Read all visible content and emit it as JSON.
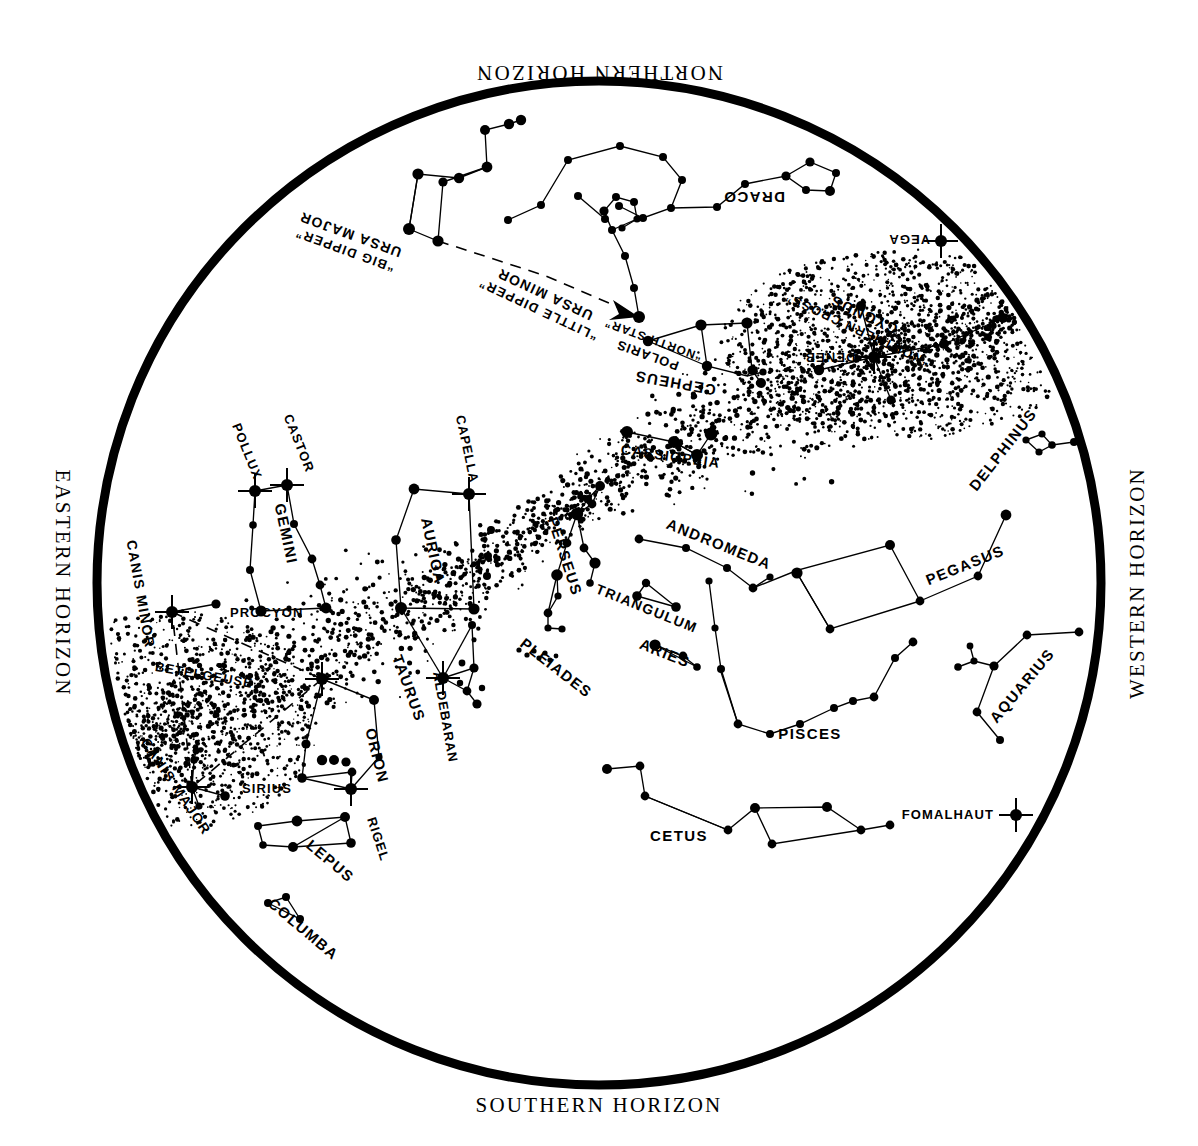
{
  "chart": {
    "horizons": {
      "north": "NORTHERN HORIZON",
      "south": "SOUTHERN HORIZON",
      "east": "EASTERN HORIZON",
      "west": "WESTERN HORIZON"
    },
    "colors": {
      "ink": "#000000",
      "background": "#ffffff"
    }
  },
  "chart_data": {
    "type": "scatter",
    "xlabel": "",
    "ylabel": "",
    "projection": "circular sky map, zenith centered",
    "grid": false,
    "legend_position": "none",
    "center": [
      599,
      583
    ],
    "radius": 505,
    "horizon_labels": {
      "north": "NORTHERN HORIZON",
      "south": "SOUTHERN HORIZON",
      "east": "EASTERN HORIZON",
      "west": "WESTERN HORIZON"
    },
    "named_stars": [
      {
        "name": "POLARIS",
        "alt_name": "“NORTH STAR”",
        "x": 639,
        "y": 317,
        "marker": "dot",
        "mag_size": 5
      },
      {
        "name": "VEGA",
        "x": 941,
        "y": 241,
        "marker": "burst",
        "mag_size": 6
      },
      {
        "name": "DENEB",
        "x": 874,
        "y": 357,
        "marker": "burst",
        "mag_size": 6
      },
      {
        "name": "CAPELLA",
        "x": 469,
        "y": 494,
        "marker": "burst",
        "mag_size": 6
      },
      {
        "name": "CASTOR",
        "x": 287,
        "y": 485,
        "marker": "burst",
        "mag_size": 6
      },
      {
        "name": "POLLUX",
        "x": 255,
        "y": 491,
        "marker": "burst",
        "mag_size": 6
      },
      {
        "name": "PROCYON",
        "x": 172,
        "y": 612,
        "marker": "burst",
        "mag_size": 6
      },
      {
        "name": "BETELGEUSE",
        "x": 322,
        "y": 679,
        "marker": "burst",
        "mag_size": 6
      },
      {
        "name": "SIRIUS",
        "x": 192,
        "y": 787,
        "marker": "burst",
        "mag_size": 6
      },
      {
        "name": "RIGEL",
        "x": 351,
        "y": 789,
        "marker": "burst",
        "mag_size": 6
      },
      {
        "name": "ALDEBARAN",
        "x": 443,
        "y": 678,
        "marker": "burst",
        "mag_size": 6
      },
      {
        "name": "FOMALHAUT",
        "x": 1016,
        "y": 815,
        "marker": "burst",
        "mag_size": 6
      }
    ],
    "constellations": [
      {
        "name": "URSA MAJOR",
        "alt_name": "“BIG DIPPER”",
        "label_x": 352,
        "label_y": 230,
        "rotation": 200,
        "flipped": true
      },
      {
        "name": "URSA MINOR",
        "alt_name": "“LITTLE DIPPER”",
        "label_x": 547,
        "label_y": 290,
        "rotation": 205,
        "flipped": true
      },
      {
        "name": "DRACO",
        "label_x": 754,
        "label_y": 192,
        "rotation": 180,
        "flipped": true
      },
      {
        "name": "CEPHEUS",
        "label_x": 676,
        "label_y": 378,
        "rotation": 190,
        "flipped": true
      },
      {
        "name": "CYGNUS",
        "alt_name": "“NORTHERN CROSS”",
        "label_x": 866,
        "label_y": 310,
        "rotation": 205,
        "flipped": true
      },
      {
        "name": "CASSIOPEIA",
        "label_x": 670,
        "label_y": 461,
        "rotation": 8,
        "flipped": false
      },
      {
        "name": "PERSEUS",
        "label_x": 560,
        "label_y": 558,
        "rotation": 72,
        "flipped": false
      },
      {
        "name": "ANDROMEDA",
        "label_x": 717,
        "label_y": 549,
        "rotation": 22,
        "flipped": false
      },
      {
        "name": "AURIGA",
        "label_x": 428,
        "label_y": 552,
        "rotation": 78,
        "flipped": false
      },
      {
        "name": "GEMINI",
        "label_x": 281,
        "label_y": 535,
        "rotation": 78,
        "flipped": false
      },
      {
        "name": "TAURUS",
        "label_x": 404,
        "label_y": 690,
        "rotation": 70,
        "flipped": false
      },
      {
        "name": "ORION",
        "label_x": 372,
        "label_y": 757,
        "rotation": 76,
        "flipped": false
      },
      {
        "name": "CANIS MINOR",
        "label_x": 136,
        "label_y": 595,
        "rotation": 80,
        "flipped": false
      },
      {
        "name": "CANIS MAJOR",
        "label_x": 172,
        "label_y": 789,
        "rotation": 56,
        "flipped": false
      },
      {
        "name": "LEPUS",
        "label_x": 327,
        "label_y": 865,
        "rotation": 40,
        "flipped": false
      },
      {
        "name": "COLUMBA",
        "label_x": 300,
        "label_y": 933,
        "rotation": 40,
        "flipped": false
      },
      {
        "name": "TRIANGULUM",
        "label_x": 645,
        "label_y": 613,
        "rotation": 22,
        "flipped": false
      },
      {
        "name": "ARIES",
        "label_x": 663,
        "label_y": 658,
        "rotation": 22,
        "flipped": false
      },
      {
        "name": "PISCES",
        "label_x": 810,
        "label_y": 739,
        "rotation": 0,
        "flipped": false
      },
      {
        "name": "CETUS",
        "label_x": 679,
        "label_y": 841,
        "rotation": 0,
        "flipped": false
      },
      {
        "name": "PEGASUS",
        "label_x": 967,
        "label_y": 570,
        "rotation": -22,
        "flipped": false
      },
      {
        "name": "DELPHINUS",
        "label_x": 1007,
        "label_y": 453,
        "rotation": -52,
        "flipped": false
      },
      {
        "name": "AQUARIUS",
        "label_x": 1026,
        "label_y": 689,
        "rotation": -50,
        "flipped": false
      },
      {
        "name": "PLEIADES",
        "label_x": 553,
        "label_y": 672,
        "rotation": 38,
        "flipped": false
      }
    ],
    "milky_way": "diagonal speckled band running from lower-left (Canis Major / eastern horizon) through Orion, Taurus, Auriga, Perseus, Cassiopeia to Cygnus near the western horizon"
  }
}
